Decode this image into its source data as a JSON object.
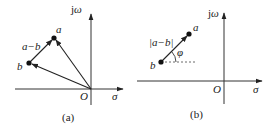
{
  "diagram": {
    "type": "complex-plane-vectors",
    "panels": [
      {
        "id": "a",
        "caption": "(a)",
        "axes": {
          "horizontal": "σ",
          "vertical": "jω",
          "origin": "O"
        },
        "points": [
          {
            "name": "a",
            "label": "a"
          },
          {
            "name": "b",
            "label": "b"
          }
        ],
        "vectors": [
          {
            "from": "O",
            "to": "a"
          },
          {
            "from": "O",
            "to": "b"
          },
          {
            "from": "b",
            "to": "a",
            "label": "a−b"
          }
        ]
      },
      {
        "id": "b",
        "caption": "(b)",
        "axes": {
          "horizontal": "σ",
          "vertical": "jω",
          "origin": "O"
        },
        "points": [
          {
            "name": "a",
            "label": "a"
          },
          {
            "name": "b",
            "label": "b"
          }
        ],
        "vectors": [
          {
            "from": "b",
            "to": "a",
            "label": "|a−b|"
          }
        ],
        "angle": {
          "label": "φ",
          "reference": "horizontal dashed line through b"
        }
      }
    ]
  },
  "labels": {
    "a_panel": {
      "jw": "jω",
      "sigma": "σ",
      "origin": "O",
      "point_a": "a",
      "point_b": "b",
      "diff": "a−b",
      "caption": "(a)"
    },
    "b_panel": {
      "jw": "jω",
      "sigma": "σ",
      "origin": "O",
      "point_a": "a",
      "point_b": "b",
      "mag": "|a−b|",
      "phi": "φ",
      "caption": "(b)"
    }
  }
}
